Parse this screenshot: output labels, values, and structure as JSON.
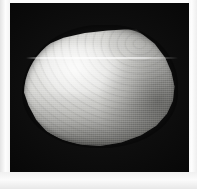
{
  "image": {
    "subject": "bivalve-seashell",
    "description": "Grayscale photograph of a single smooth bivalve (clam) shell viewed from the outside, lit from the upper left, against a plain black background.",
    "orientation": "hinge/umbo at upper right, ventral margin at lower left",
    "background_color": "#050505",
    "paper_margin_color": "#fcfcfc",
    "shell_highlight_color": "#f4f4f2",
    "shell_midtone_color": "#d2d2cf",
    "shell_shadow_color": "#9a9a97",
    "artifact": "thin bright horizontal scan line crossing the upper third of the shell",
    "caption": ""
  },
  "frame": {
    "photo_left": 10,
    "photo_top": 3,
    "photo_width": 179,
    "photo_height": 169,
    "canvas_width": 197,
    "canvas_height": 189
  }
}
